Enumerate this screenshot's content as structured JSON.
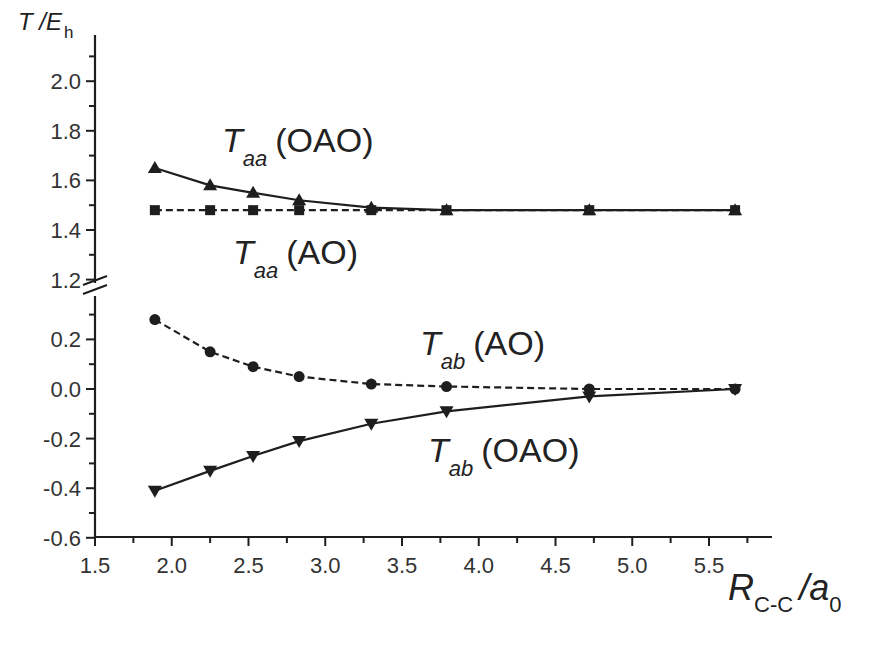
{
  "chart_data": {
    "type": "line",
    "title": "",
    "xlabel": {
      "main": "R",
      "sub": "C-C",
      "unit_main": "/a",
      "unit_sub": "0"
    },
    "ylabel": {
      "main": "T",
      "unit_main": "/E",
      "unit_sub": "h"
    },
    "x": [
      1.89,
      2.25,
      2.53,
      2.83,
      3.3,
      3.79,
      4.72,
      5.67
    ],
    "xlim": [
      1.5,
      5.9
    ],
    "x_ticks": [
      "1.5",
      "2.0",
      "2.5",
      "3.0",
      "3.5",
      "4.0",
      "4.5",
      "5.0",
      "5.5"
    ],
    "y_axis_break": true,
    "upper_panel": {
      "ylim": [
        1.2,
        2.1
      ],
      "y_ticks": [
        "1.2",
        "1.4",
        "1.6",
        "1.8",
        "2.0"
      ]
    },
    "lower_panel": {
      "ylim": [
        -0.6,
        0.33
      ],
      "y_ticks": [
        "-0.6",
        "-0.4",
        "-0.2",
        "0.0",
        "0.2"
      ]
    },
    "grid": false,
    "legend": "inline labels",
    "series": [
      {
        "name": "T_aa (OAO)",
        "label_main": "T",
        "label_sub": "aa",
        "label_tag": "(OAO)",
        "panel": "upper",
        "marker": "triangle-up",
        "line": "solid",
        "values": [
          1.65,
          1.58,
          1.55,
          1.52,
          1.49,
          1.48,
          1.48,
          1.48
        ]
      },
      {
        "name": "T_aa (AO)",
        "label_main": "T",
        "label_sub": "aa",
        "label_tag": "(AO)",
        "panel": "upper",
        "marker": "square",
        "line": "dashed",
        "values": [
          1.48,
          1.48,
          1.48,
          1.48,
          1.48,
          1.48,
          1.48,
          1.48
        ]
      },
      {
        "name": "T_ab (AO)",
        "label_main": "T",
        "label_sub": "ab",
        "label_tag": "(AO)",
        "panel": "lower",
        "marker": "circle",
        "line": "dashed",
        "values": [
          0.28,
          0.15,
          0.09,
          0.05,
          0.02,
          0.01,
          0.0,
          0.0
        ]
      },
      {
        "name": "T_ab (OAO)",
        "label_main": "T",
        "label_sub": "ab",
        "label_tag": "(OAO)",
        "panel": "lower",
        "marker": "triangle-down",
        "line": "solid",
        "values": [
          -0.41,
          -0.33,
          -0.27,
          -0.21,
          -0.14,
          -0.09,
          -0.03,
          0.0
        ]
      }
    ],
    "colors": {
      "line": "#1e1e1e",
      "text": "#222222",
      "background": "#ffffff"
    }
  }
}
